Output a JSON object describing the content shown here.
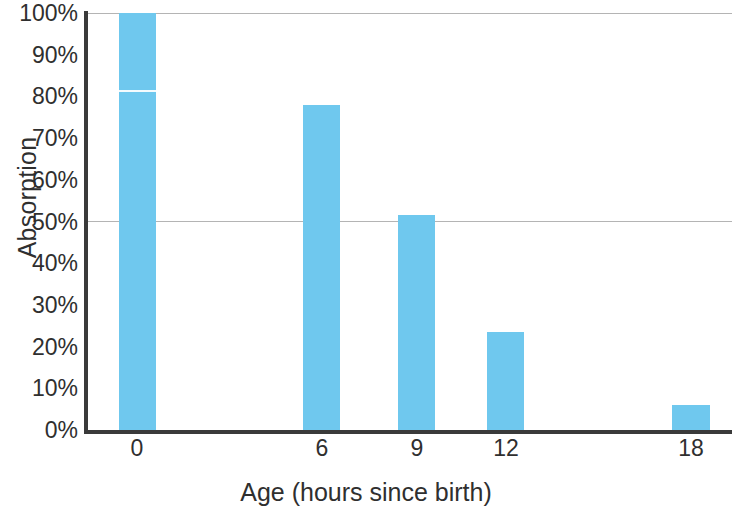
{
  "chart_data": {
    "type": "bar",
    "title": "",
    "subtitle": "",
    "xlabel": "Age (hours since birth)",
    "ylabel": "Absorption",
    "categories": [
      "0",
      "6",
      "9",
      "12",
      "18"
    ],
    "x": [
      0,
      6,
      9,
      12,
      18
    ],
    "values": [
      100,
      78,
      51.5,
      23.5,
      6
    ],
    "value_labels": [
      "100%",
      "78%",
      "51.5%",
      "23.5%",
      "6%"
    ],
    "ylim": [
      0,
      100
    ],
    "xlim": [
      0,
      18
    ],
    "y_tick_labels": [
      "100%",
      "90%",
      "80%",
      "70%",
      "60%",
      "50%",
      "40%",
      "30%",
      "20%",
      "10%",
      "0%"
    ],
    "y_tick_values": [
      100,
      90,
      80,
      70,
      60,
      50,
      40,
      30,
      20,
      10,
      0
    ],
    "x_tick_labels": [
      "0",
      "6",
      "9",
      "12",
      "18"
    ],
    "grid": "horizontal-partial",
    "gridline_values": [
      100,
      50
    ],
    "legend": null,
    "legend_position": "none",
    "bar_color": "#6fc8ee",
    "axis_color": "#3a3a3a",
    "grid_color": "#b4b4b4",
    "text_color": "#2f2f2f",
    "background": "#ffffff",
    "annotations": []
  },
  "geometry": {
    "plot_left": 88,
    "plot_top": 13,
    "plot_width": 644,
    "plot_height": 417,
    "bar_px": [
      {
        "left": 31,
        "width": 37,
        "height_pct": 100
      },
      {
        "left": 215,
        "width": 37,
        "height_pct": 78
      },
      {
        "left": 310,
        "width": 37,
        "height_pct": 51.5
      },
      {
        "left": 399,
        "width": 37,
        "height_pct": 23.5
      },
      {
        "left": 584,
        "width": 38,
        "height_pct": 6
      }
    ],
    "x_tick_px": [
      49,
      234,
      329,
      418,
      603
    ],
    "artifact_bar_index": 0,
    "artifact_pct": 81
  }
}
